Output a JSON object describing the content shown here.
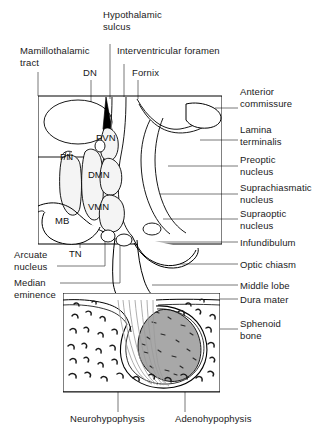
{
  "figure": {
    "colors": {
      "outline": "#000000",
      "leader": "#555555",
      "adenohypophysis_fill": "#a8a8a8",
      "nucleus_fill": "#f2f2f2",
      "background": "#ffffff"
    }
  },
  "labels_top": {
    "hypothalamic_sulcus": "Hypothalamic\nsulcus",
    "mamillothalamic_tract": "Mamillothalamic\ntract",
    "interventricular_foramen": "Interventricular foramen",
    "dn": "DN",
    "fornix": "Fornix"
  },
  "labels_right": [
    {
      "id": "anterior-commissure",
      "text": "Anterior\ncommissure"
    },
    {
      "id": "lamina-terminalis",
      "text": "Lamina\nterminalis"
    },
    {
      "id": "preoptic-nucleus",
      "text": "Preoptic\nnucleus"
    },
    {
      "id": "suprachiasmatic-nucleus",
      "text": "Suprachiasmatic\nnucleus"
    },
    {
      "id": "supraoptic-nucleus",
      "text": "Supraoptic\nnucleus"
    },
    {
      "id": "infundibulum",
      "text": "Infundibulum"
    },
    {
      "id": "optic-chiasm",
      "text": "Optic chiasm"
    },
    {
      "id": "middle-lobe",
      "text": "Middle lobe"
    },
    {
      "id": "dura-mater",
      "text": "Dura mater"
    },
    {
      "id": "sphenoid-bone",
      "text": "Sphenoid\nbone"
    }
  ],
  "labels_left": [
    {
      "id": "arcuate-nucleus",
      "text": "Arcuate\nnucleus"
    },
    {
      "id": "median-eminence",
      "text": "Median\neminence"
    }
  ],
  "labels_inner": [
    {
      "id": "pvn",
      "text": "PVN"
    },
    {
      "id": "pn",
      "text": "PN"
    },
    {
      "id": "dmn",
      "text": "DMN"
    },
    {
      "id": "vmn",
      "text": "VMN"
    },
    {
      "id": "mb",
      "text": "MB"
    },
    {
      "id": "tn",
      "text": "TN"
    }
  ],
  "labels_bottom": {
    "neurohypophysis": "Neurohypophysis",
    "adenohypophysis": "Adenohypophysis"
  }
}
